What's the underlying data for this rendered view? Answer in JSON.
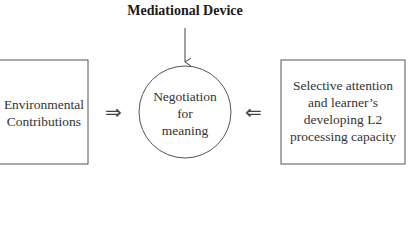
{
  "diagram": {
    "top_label": "Mediational Device",
    "left_box": {
      "lines": [
        "Environmental",
        "Contributions"
      ]
    },
    "center_circle": {
      "lines": [
        "Negotiation",
        "for",
        "meaning"
      ]
    },
    "right_box": {
      "lines": [
        "Selective attention",
        "and learner’s",
        "developing L2",
        "processing capacity"
      ]
    },
    "left_arrow_glyph": "⇒",
    "right_arrow_glyph": "⇐"
  }
}
